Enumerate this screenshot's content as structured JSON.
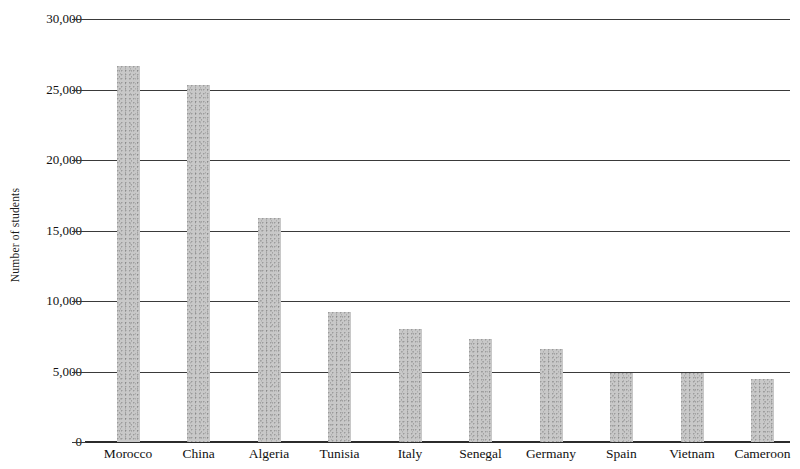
{
  "chart_data": {
    "type": "bar",
    "title": "",
    "xlabel": "",
    "ylabel": "Number of students",
    "categories": [
      "Morocco",
      "China",
      "Algeria",
      "Tunisia",
      "Italy",
      "Senegal",
      "Germany",
      "Spain",
      "Vietnam",
      "Cameroon"
    ],
    "values": [
      26700,
      25300,
      15900,
      9200,
      8000,
      7300,
      6600,
      4900,
      4900,
      4500
    ],
    "ylim": [
      0,
      30000
    ],
    "y_ticks": [
      0,
      5000,
      10000,
      15000,
      20000,
      25000,
      30000
    ],
    "y_tick_labels": [
      "0",
      "5,000",
      "10,000",
      "15,000",
      "20,000",
      "25,000",
      "30,000"
    ],
    "grid": true,
    "legend": null,
    "bar_color": "#c8c8c8",
    "axis_color": "#3a3a3a"
  }
}
